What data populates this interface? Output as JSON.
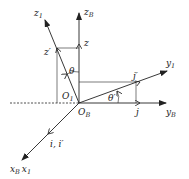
{
  "diagram": {
    "type": "coordinate-frame-rotation",
    "origin_labels": {
      "body": "O",
      "body_sub": "B",
      "frame1": "O",
      "frame1_sub": "1"
    },
    "axes": {
      "zB": {
        "main": "z",
        "sub": "B"
      },
      "z1": {
        "main": "z",
        "sub": "1"
      },
      "yB": {
        "main": "y",
        "sub": "B"
      },
      "y1": {
        "main": "y",
        "sub": "1"
      },
      "xB": {
        "main": "x",
        "sub": "B"
      },
      "x1": {
        "main": "x",
        "sub": "1"
      }
    },
    "unit_vectors": {
      "z": "z",
      "z_prime": "z′",
      "j": "j",
      "j_prime": "j′",
      "i": "i, i′"
    },
    "angles": {
      "theta": "θ",
      "theta_prime": "θ′"
    },
    "colors": {
      "stroke": "#222222",
      "background": "#ffffff"
    }
  }
}
